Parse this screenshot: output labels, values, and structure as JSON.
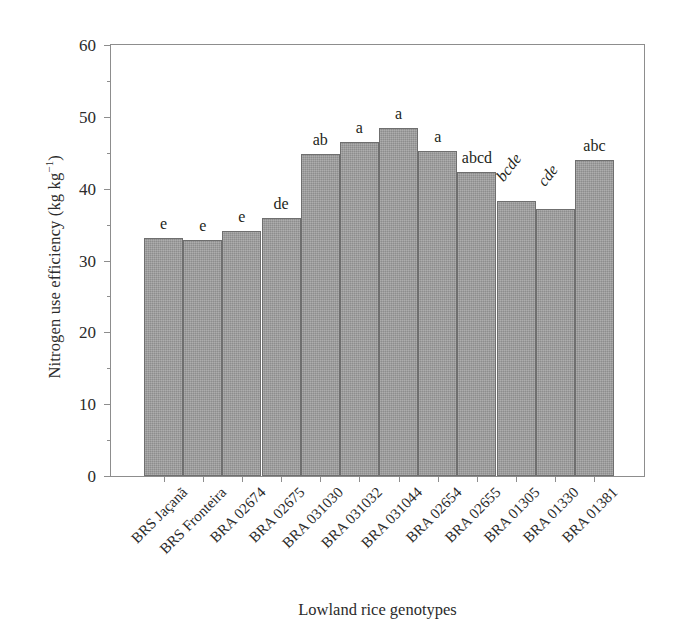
{
  "chart_data": {
    "type": "bar",
    "title": "",
    "xlabel": "Lowland rice genotypes",
    "ylabel": "Nitrogen use efficiency (kg kg",
    "ylabel_sup": "−1",
    "ylabel_tail": ")",
    "ylabel_full": "Nitrogen use efficiency (kg kg⁻¹)",
    "ylim": [
      0,
      60
    ],
    "yticks": [
      0,
      10,
      20,
      30,
      40,
      50,
      60
    ],
    "ytick_labels": [
      "0",
      "10",
      "20",
      "30",
      "40",
      "50",
      "60"
    ],
    "yminor_ticks": [
      5,
      15,
      25,
      35,
      45,
      55
    ],
    "grid": false,
    "legend": "none",
    "bar_color": "#9b9b9b",
    "bar_edge_color": "#6f6f6f",
    "axis_color": "#8d8d8d",
    "text_color": "#231f20",
    "categories": [
      "BRS Jaçanã",
      "BRS Fronteira",
      "BRA 02674",
      "BRA 02675",
      "BRA 031030",
      "BRA 031032",
      "BRA 031044",
      "BRA 02654",
      "BRA 02655",
      "BRA 01305",
      "BRA 01330",
      "BRA 01381"
    ],
    "values": [
      33.2,
      32.8,
      34.1,
      35.9,
      44.8,
      46.5,
      48.5,
      45.2,
      42.3,
      38.3,
      37.2,
      44.0
    ],
    "annotations": [
      "e",
      "e",
      "e",
      "de",
      "ab",
      "a",
      "a",
      "a",
      "abcd",
      "bcde",
      "cde",
      "abc"
    ],
    "annotation_rotated": [
      false,
      false,
      false,
      false,
      false,
      false,
      false,
      false,
      false,
      true,
      true,
      false
    ]
  }
}
